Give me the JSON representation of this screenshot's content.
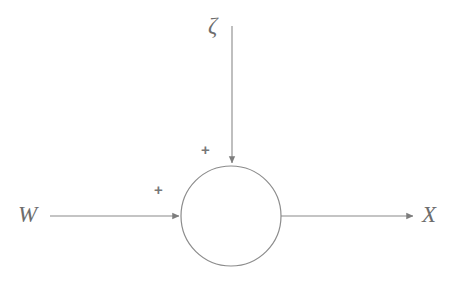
{
  "diagram": {
    "type": "signal-flow-block-diagram",
    "background_color": "#ffffff",
    "stroke_color": "#808080",
    "text_color": "#6d6d6d",
    "labels": {
      "noise_input": "ζ",
      "signal_input": "W",
      "output": "X",
      "sign_top": "+",
      "sign_left": "+"
    },
    "nodes": [
      {
        "name": "summing-junction",
        "shape": "circle",
        "cx": 231,
        "cy": 216,
        "r": 50
      }
    ],
    "edges": [
      {
        "name": "noise-input-arrow",
        "from_label": "ζ",
        "orientation": "vertical",
        "x": 232,
        "y_start": 26,
        "y_end": 166,
        "sign": "+",
        "arrowhead": "solid-triangle"
      },
      {
        "name": "signal-input-arrow",
        "from_label": "W",
        "orientation": "horizontal",
        "y": 216,
        "x_start": 50,
        "x_end": 182,
        "sign": "+",
        "arrowhead": "solid-triangle"
      },
      {
        "name": "output-arrow",
        "to_label": "X",
        "orientation": "horizontal",
        "y": 216,
        "x_start": 281,
        "x_end": 416,
        "arrowhead": "solid-triangle"
      }
    ],
    "equation": "X = W + ζ"
  }
}
